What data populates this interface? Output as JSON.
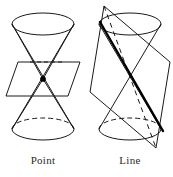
{
  "figure": {
    "kind": "geometry-diagram",
    "background_color": "#ffffff",
    "stroke_color": "#1a1a1a",
    "accent_color": "#000000",
    "panels": [
      {
        "id": "point-panel",
        "label": "Point",
        "description": "double cone cut by a horizontal plane through the apex",
        "plane_orientation": "horizontal",
        "intersection_type": "point",
        "intersection_marker": "filled-dot",
        "cone": {
          "apex": {
            "x": 43,
            "y": 79
          },
          "top_ellipse": {
            "cx": 43,
            "cy": 24,
            "rx": 31,
            "ry": 11,
            "hidden_arc": "none"
          },
          "bottom_ellipse": {
            "cx": 43,
            "cy": 129,
            "rx": 31,
            "ry": 11,
            "hidden_arc": "upper"
          }
        },
        "plane": {
          "shape": "parallelogram",
          "points": "18,62 80,62 68,96 6,96"
        }
      },
      {
        "id": "line-panel",
        "label": "Line",
        "description": "double cone cut by a plane tangent along a generator line",
        "plane_orientation": "steeply-tilted",
        "intersection_type": "line",
        "intersection_marker": "thick-segment",
        "cone": {
          "apex": {
            "x": 130,
            "y": 79
          },
          "top_ellipse": {
            "cx": 130,
            "cy": 24,
            "rx": 31,
            "ry": 11,
            "hidden_arc": "none"
          },
          "bottom_ellipse": {
            "cx": 130,
            "cy": 129,
            "rx": 31,
            "ry": 11,
            "hidden_arc": "upper"
          }
        },
        "plane": {
          "shape": "parallelogram",
          "points": "104,6 170,62 156,148 90,92"
        },
        "tangent_line": {
          "x1": 100,
          "y1": 22,
          "x2": 163,
          "y2": 131,
          "width": 2.4
        }
      }
    ]
  },
  "labels": {
    "point": "Point",
    "line": "Line"
  }
}
